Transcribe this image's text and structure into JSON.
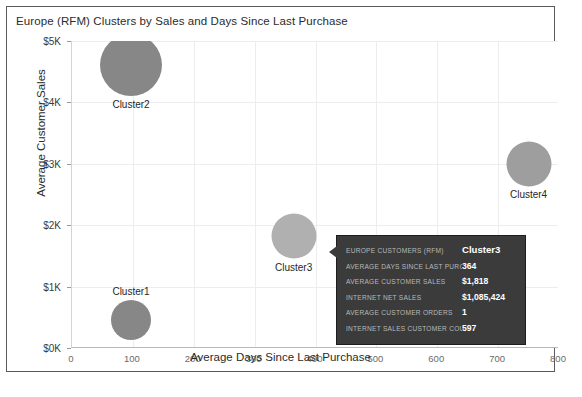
{
  "chart_data": {
    "type": "scatter",
    "title": "Europe (RFM) Clusters by Sales and Days Since Last Purchase",
    "xlabel": "Average Days Since Last Purchase",
    "ylabel": "Average Customer Sales",
    "xlim": [
      0,
      800
    ],
    "ylim": [
      0,
      5000
    ],
    "xticks": [
      "0",
      "100",
      "200",
      "300",
      "400",
      "500",
      "600",
      "700",
      "800"
    ],
    "xtick_values": [
      0,
      100,
      200,
      300,
      400,
      500,
      600,
      700,
      800
    ],
    "yticks": [
      "$0K",
      "$1K",
      "$2K",
      "$3K",
      "$4K",
      "$5K"
    ],
    "ytick_values": [
      0,
      1000,
      2000,
      3000,
      4000,
      5000
    ],
    "grid": true,
    "legend": "none",
    "points": [
      {
        "label": "Cluster1",
        "x": 97,
        "y": 460,
        "size": 40,
        "color": "#878787",
        "highlighted": false,
        "clipped": false,
        "label_position": "above"
      },
      {
        "label": "Cluster2",
        "x": 97,
        "y": 4610,
        "size": 62,
        "color": "#878787",
        "highlighted": false,
        "clipped": true,
        "label_position": "below"
      },
      {
        "label": "Cluster3",
        "x": 364,
        "y": 1818,
        "size": 45,
        "color": "#b0b0b0",
        "highlighted": true,
        "clipped": false,
        "label_position": "below"
      },
      {
        "label": "Cluster4",
        "x": 750,
        "y": 3000,
        "size": 45,
        "color": "#9e9e9e",
        "highlighted": false,
        "clipped": false,
        "label_position": "below"
      }
    ]
  },
  "tooltip": {
    "rows": [
      {
        "key": "Europe Customers (RFM)",
        "value": "Cluster3"
      },
      {
        "key": "Average Days Since Last Purchase",
        "value": "364"
      },
      {
        "key": "Average Customer Sales",
        "value": "$1,818"
      },
      {
        "key": "Internet Net Sales",
        "value": "$1,085,424"
      },
      {
        "key": "Average Customer Orders",
        "value": "1"
      },
      {
        "key": "Internet Sales Customer Count",
        "value": "597"
      }
    ]
  },
  "colors": {
    "bubble_default": "#878787",
    "bubble_highlighted": "#b0b0b0",
    "tooltip_background": "#3b3b3b",
    "frame_border": "#5a5a5a",
    "gridline": "#ededed"
  }
}
